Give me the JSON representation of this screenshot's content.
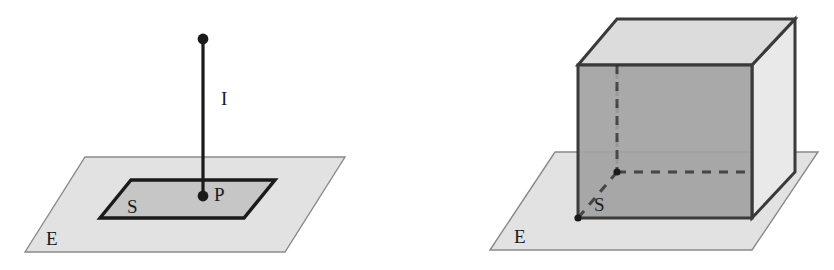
{
  "figure": {
    "background_color": "#ffffff",
    "width": 834,
    "height": 270
  },
  "palette": {
    "plane_fill": "#e2e2e2",
    "plane_stroke": "#8a8a8a",
    "surface_fill": "#c6c6c6",
    "surface_stroke": "#1a1a1a",
    "cube_front_fill": "#a3a3a3",
    "cube_top_fill": "#dcdcdc",
    "cube_right_fill": "#e9e9e9",
    "cube_stroke": "#3a3a3a",
    "hidden_edge_stroke": "#1a1a1a",
    "line_stroke": "#1a1a1a",
    "point_fill": "#1a1a1a",
    "label_color": "#1a1a1a"
  },
  "panels": [
    {
      "id": "left",
      "name": "point-and-surface-panel",
      "labels": {
        "line": "I",
        "point": "P",
        "surface": "S",
        "plane": "E"
      },
      "geometry": {
        "plane_points": "25,252 85,157 345,157 285,252",
        "surface_points": "100,218 131,180 275,180 244,218",
        "line_x1": 203,
        "line_y1": 39,
        "line_x2": 203,
        "line_y2": 196,
        "point_top_x": 203,
        "point_top_y": 39,
        "point_base_x": 203,
        "point_base_y": 196,
        "label_line_x": 221,
        "label_line_y": 105,
        "label_point_x": 214,
        "label_point_y": 201,
        "label_surface_x": 127,
        "label_surface_y": 213,
        "label_plane_x": 46,
        "label_plane_y": 245
      }
    },
    {
      "id": "right",
      "name": "cube-panel",
      "labels": {
        "surface": "S",
        "plane": "E"
      },
      "geometry": {
        "plane_points": "73,250 138,152 401,152 335,250",
        "front_face_points": "161,65 335,65 335,218 161,218",
        "top_face_points": "161,65 200,19 378,19 335,65",
        "right_face_points": "335,65 378,19 378,172 335,218",
        "hidden_vertex_x": 200,
        "hidden_vertex_y": 172,
        "hidden_vertical_x": 200,
        "hidden_vertical_y1": 19,
        "hidden_vertical_y2": 172,
        "hidden_horizontal_x1": 200,
        "hidden_horizontal_y1": 172,
        "hidden_horizontal_x2": 378,
        "hidden_horizontal_y2": 172,
        "hidden_diagonal_x1": 200,
        "hidden_diagonal_y1": 172,
        "hidden_diagonal_x2": 161,
        "hidden_diagonal_y2": 218,
        "label_surface_x": 177,
        "label_surface_y": 211,
        "label_plane_x": 97,
        "label_plane_y": 243
      }
    }
  ]
}
